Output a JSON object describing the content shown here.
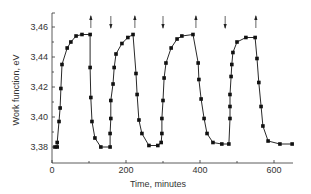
{
  "chart_data": {
    "type": "line",
    "title": "",
    "xlabel": "Time, minutes",
    "ylabel": "Work function, eV",
    "xlim": [
      0,
      650
    ],
    "ylim": [
      3.375,
      3.465
    ],
    "xticks": [
      0,
      200,
      400,
      600
    ],
    "xminor": [
      100,
      300,
      500
    ],
    "yticks": [
      3.38,
      3.4,
      3.42,
      3.44,
      3.46
    ],
    "ytick_labels": [
      "3,38",
      "3,40",
      "3,42",
      "3,44",
      "3,46"
    ],
    "grid": false,
    "legend": null,
    "markers": "square",
    "series": [
      {
        "name": "Work function",
        "x": [
          8,
          14,
          14,
          19,
          22,
          24,
          27,
          41,
          51,
          65,
          81,
          103,
          103,
          105,
          108,
          116,
          132,
          157,
          157,
          159,
          159,
          165,
          168,
          173,
          189,
          205,
          219,
          227,
          230,
          235,
          243,
          262,
          286,
          295,
          297,
          297,
          300,
          303,
          308,
          322,
          338,
          351,
          381,
          395,
          397,
          403,
          411,
          419,
          435,
          459,
          478,
          481,
          481,
          481,
          484,
          486,
          489,
          500,
          524,
          549,
          554,
          559,
          565,
          570,
          584,
          616,
          649
        ],
        "y": [
          3.38,
          3.38,
          3.383,
          3.397,
          3.406,
          3.419,
          3.435,
          3.446,
          3.45,
          3.454,
          3.455,
          3.455,
          3.433,
          3.413,
          3.397,
          3.386,
          3.38,
          3.38,
          3.389,
          3.399,
          3.411,
          3.422,
          3.433,
          3.442,
          3.449,
          3.453,
          3.455,
          3.429,
          3.415,
          3.398,
          3.389,
          3.381,
          3.381,
          3.383,
          3.389,
          3.399,
          3.411,
          3.426,
          3.436,
          3.446,
          3.452,
          3.454,
          3.455,
          3.436,
          3.425,
          3.412,
          3.399,
          3.389,
          3.383,
          3.382,
          3.382,
          3.399,
          3.407,
          3.415,
          3.427,
          3.435,
          3.443,
          3.45,
          3.453,
          3.453,
          3.439,
          3.423,
          3.407,
          3.394,
          3.384,
          3.382,
          3.382
        ]
      }
    ],
    "annotations": [
      {
        "type": "arrow-up",
        "x": 105,
        "meaning": "gas on/off switch"
      },
      {
        "type": "arrow-down",
        "x": 159
      },
      {
        "type": "arrow-up",
        "x": 224
      },
      {
        "type": "arrow-down",
        "x": 300
      },
      {
        "type": "arrow-up",
        "x": 389
      },
      {
        "type": "arrow-down",
        "x": 468
      },
      {
        "type": "arrow-up",
        "x": 551
      }
    ]
  }
}
